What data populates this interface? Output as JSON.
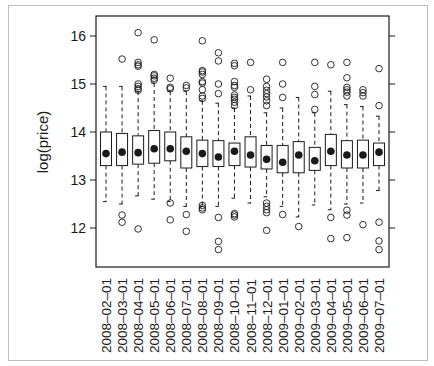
{
  "chart_data": {
    "type": "box",
    "title": "",
    "xlabel": "",
    "ylabel": "log(price)",
    "ylim": [
      11.25,
      16.4
    ],
    "yticks": [
      12,
      13,
      14,
      15,
      16
    ],
    "grid": false,
    "legend": null,
    "categories": [
      "2008-02-01",
      "2008-03-01",
      "2008-04-01",
      "2008-05-01",
      "2008-06-01",
      "2008-07-01",
      "2008-08-01",
      "2008-09-01",
      "2008-10-01",
      "2008-11-01",
      "2008-12-01",
      "2009-01-01",
      "2009-02-01",
      "2009-03-01",
      "2009-04-01",
      "2009-05-01",
      "2009-06-01",
      "2009-07-01"
    ],
    "boxes": [
      {
        "median": 13.55,
        "q1": 13.3,
        "q3": 14.0,
        "whisker_low": 12.55,
        "whisker_high": 14.95,
        "outliers": []
      },
      {
        "median": 13.58,
        "q1": 13.3,
        "q3": 13.97,
        "whisker_low": 12.5,
        "whisker_high": 14.95,
        "outliers": [
          15.52,
          12.27,
          12.12
        ]
      },
      {
        "median": 13.57,
        "q1": 13.33,
        "q3": 13.92,
        "whisker_low": 12.67,
        "whisker_high": 14.85,
        "outliers": [
          16.07,
          15.45,
          15.4,
          15.37,
          15.0,
          14.95,
          14.9,
          14.87,
          11.98
        ]
      },
      {
        "median": 13.65,
        "q1": 13.35,
        "q3": 14.03,
        "whisker_low": 12.6,
        "whisker_high": 15.02,
        "outliers": [
          15.92,
          15.2,
          15.17,
          15.12,
          15.08
        ]
      },
      {
        "median": 13.65,
        "q1": 13.4,
        "q3": 14.0,
        "whisker_low": 12.55,
        "whisker_high": 14.85,
        "outliers": [
          15.12,
          14.93,
          14.9,
          12.52,
          12.17
        ]
      },
      {
        "median": 13.6,
        "q1": 13.25,
        "q3": 13.9,
        "whisker_low": 12.45,
        "whisker_high": 14.85,
        "outliers": [
          14.97,
          14.92,
          12.28,
          11.93
        ]
      },
      {
        "median": 13.55,
        "q1": 13.28,
        "q3": 13.83,
        "whisker_low": 12.45,
        "whisker_high": 14.65,
        "outliers": [
          15.9,
          15.28,
          15.25,
          15.2,
          15.05,
          15.02,
          14.88,
          14.75,
          14.7,
          12.47,
          12.42,
          12.38
        ]
      },
      {
        "median": 13.48,
        "q1": 13.28,
        "q3": 13.82,
        "whisker_low": 12.45,
        "whisker_high": 14.6,
        "outliers": [
          15.65,
          15.48,
          15.0,
          14.8,
          12.22,
          11.72,
          11.55
        ]
      },
      {
        "median": 13.6,
        "q1": 13.3,
        "q3": 13.77,
        "whisker_low": 12.62,
        "whisker_high": 14.5,
        "outliers": [
          15.43,
          15.38,
          15.05,
          14.97,
          14.93,
          14.77,
          14.72,
          14.68,
          14.62,
          14.55,
          12.3,
          12.27,
          12.23
        ]
      },
      {
        "median": 13.52,
        "q1": 13.27,
        "q3": 13.9,
        "whisker_low": 12.52,
        "whisker_high": 14.75,
        "outliers": [
          15.45,
          14.88
        ]
      },
      {
        "median": 13.43,
        "q1": 13.23,
        "q3": 13.72,
        "whisker_low": 12.65,
        "whisker_high": 14.4,
        "outliers": [
          15.1,
          14.95,
          14.87,
          14.8,
          14.73,
          14.65,
          14.55,
          12.52,
          12.45,
          12.38,
          12.32,
          11.95
        ]
      },
      {
        "median": 13.37,
        "q1": 13.15,
        "q3": 13.72,
        "whisker_low": 12.45,
        "whisker_high": 14.5,
        "outliers": [
          15.45,
          15.0,
          14.72,
          12.28
        ]
      },
      {
        "median": 13.52,
        "q1": 13.15,
        "q3": 13.8,
        "whisker_low": 12.23,
        "whisker_high": 14.72,
        "outliers": [
          12.03
        ]
      },
      {
        "median": 13.4,
        "q1": 13.2,
        "q3": 13.68,
        "whisker_low": 12.48,
        "whisker_high": 14.4,
        "outliers": [
          15.45,
          14.95,
          14.78,
          14.47
        ]
      },
      {
        "median": 13.6,
        "q1": 13.3,
        "q3": 13.95,
        "whisker_low": 12.38,
        "whisker_high": 14.85,
        "outliers": [
          15.4,
          12.22,
          11.78
        ]
      },
      {
        "median": 13.52,
        "q1": 13.25,
        "q3": 13.82,
        "whisker_low": 12.5,
        "whisker_high": 14.57,
        "outliers": [
          15.45,
          15.13,
          14.93,
          14.88,
          14.83,
          14.75,
          12.37,
          12.27,
          11.8
        ]
      },
      {
        "median": 13.52,
        "q1": 13.25,
        "q3": 13.83,
        "whisker_low": 12.52,
        "whisker_high": 14.53,
        "outliers": [
          14.88,
          14.82,
          14.75,
          12.07
        ]
      },
      {
        "median": 13.58,
        "q1": 13.3,
        "q3": 13.77,
        "whisker_low": 12.78,
        "whisker_high": 14.33,
        "outliers": [
          15.32,
          14.55,
          12.12,
          11.73,
          11.55
        ]
      }
    ]
  },
  "layout": {
    "plot_left": 96,
    "plot_right": 389,
    "plot_top": 16,
    "plot_bottom": 267,
    "y_at_16": 36,
    "px_per_unit": 48,
    "first_box_x": 106,
    "box_spacing": 16.06,
    "box_half_width": 5.5
  },
  "colors": {
    "ink": "#1a1a1a",
    "frame": "#bdbdbd"
  }
}
